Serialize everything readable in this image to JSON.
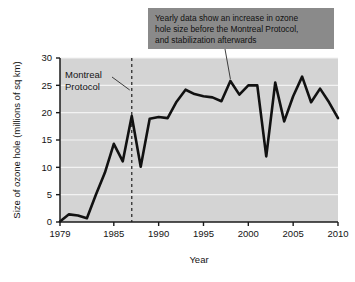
{
  "chart_data": {
    "type": "line",
    "title": "",
    "xlabel": "Year",
    "ylabel": "Size of ozone hole (millions of sq km)",
    "xlim": [
      1979,
      2010
    ],
    "ylim": [
      0,
      30
    ],
    "xticks": [
      "1979",
      "1985",
      "1990",
      "1995",
      "2000",
      "2005",
      "2010"
    ],
    "xtick_values": [
      1979,
      1985,
      1990,
      1995,
      2000,
      2005,
      2010
    ],
    "yticks": [
      "0",
      "5",
      "10",
      "15",
      "20",
      "25",
      "30"
    ],
    "ytick_values": [
      0,
      5,
      10,
      15,
      20,
      25,
      30
    ],
    "grid": "horizontal",
    "legend": "none",
    "x": [
      1979,
      1980,
      1981,
      1982,
      1983,
      1984,
      1985,
      1986,
      1987,
      1988,
      1989,
      1990,
      1991,
      1992,
      1993,
      1994,
      1995,
      1996,
      1997,
      1998,
      1999,
      2000,
      2001,
      2002,
      2003,
      2004,
      2005,
      2006,
      2007,
      2008,
      2009,
      2010
    ],
    "values": [
      0.1,
      1.4,
      1.2,
      0.7,
      5.0,
      9.0,
      14.3,
      11.1,
      19.4,
      10.1,
      18.9,
      19.2,
      19.0,
      22.0,
      24.2,
      23.4,
      23.0,
      22.8,
      22.1,
      25.8,
      23.3,
      25.0,
      25.0,
      12.0,
      25.5,
      18.4,
      23.0,
      26.6,
      21.9,
      24.4,
      21.9,
      19.0
    ],
    "series": [
      {
        "name": "Size of ozone hole",
        "color": "#111111",
        "values": [
          0.1,
          1.4,
          1.2,
          0.7,
          5.0,
          9.0,
          14.3,
          11.1,
          19.4,
          10.1,
          18.9,
          19.2,
          19.0,
          22.0,
          24.2,
          23.4,
          23.0,
          22.8,
          22.1,
          25.8,
          23.3,
          25.0,
          25.0,
          12.0,
          25.5,
          18.4,
          23.0,
          26.6,
          21.9,
          24.4,
          21.9,
          19.0
        ]
      }
    ],
    "annotations": [
      {
        "name": "montreal-protocol",
        "text_lines": [
          "Montreal",
          "Protocol"
        ],
        "marker_type": "vertical-dashed-line",
        "marker_x": 1987
      },
      {
        "name": "callout",
        "text_lines": [
          "Yearly data show an increase in ozone",
          "hole size before the Montreal Protocol,",
          "and stabilization afterwards"
        ],
        "points_to_x": 1998,
        "points_to_y": 25.8,
        "box_color": "#8a8a8a"
      }
    ],
    "plot_background": "#d4d4d4",
    "gridline_color": "#f2f2f2",
    "axis_color": "#1a1a1a"
  }
}
